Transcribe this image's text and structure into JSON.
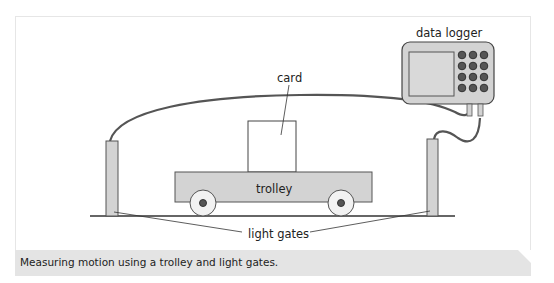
{
  "figure": {
    "labels": {
      "data_logger": "data logger",
      "card": "card",
      "trolley": "trolley",
      "light_gates": "light gates"
    },
    "caption": "Measuring motion using a trolley and light gates.",
    "colors": {
      "frame_border": "#e6e6e6",
      "caption_bg": "#e4e4e4",
      "component_fill": "#d3d3d3",
      "outline": "#444444",
      "cable": "#555555"
    }
  }
}
